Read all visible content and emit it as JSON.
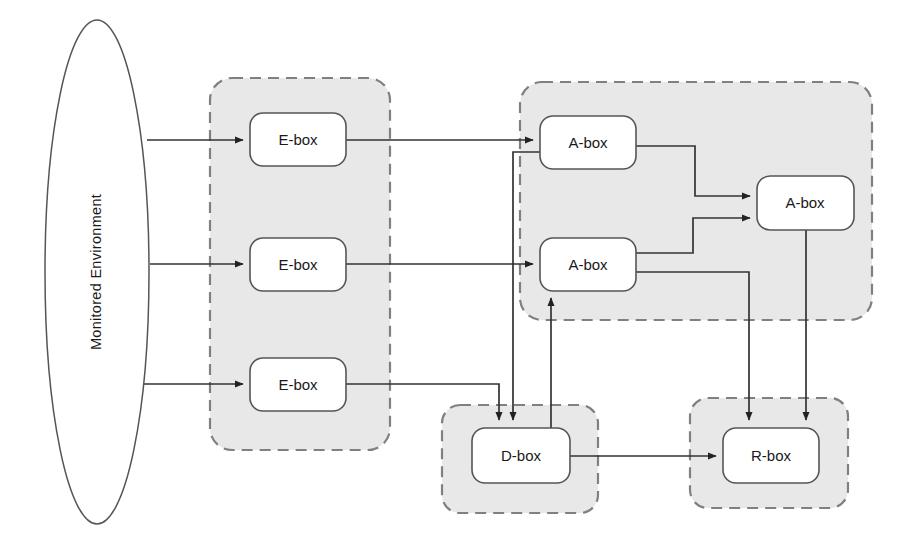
{
  "diagram": {
    "canvas": {
      "width": 902,
      "height": 544,
      "background": "#ffffff"
    },
    "colors": {
      "group_fill": "#e8e8e8",
      "group_stroke": "#808080",
      "node_fill": "#ffffff",
      "node_stroke": "#555555",
      "edge_stroke": "#333333",
      "text": "#1a1a1a"
    },
    "environment": {
      "label": "Monitored Environment",
      "shape": "ellipse",
      "orientation": "vertical-text"
    },
    "groups": [
      {
        "id": "e-group",
        "label": "",
        "x": 210,
        "y": 78,
        "width": 180,
        "height": 372
      },
      {
        "id": "a-group",
        "label": "",
        "x": 520,
        "y": 82,
        "width": 352,
        "height": 238
      },
      {
        "id": "d-group",
        "label": "",
        "x": 442,
        "y": 405,
        "width": 156,
        "height": 108
      },
      {
        "id": "r-group",
        "label": "",
        "x": 690,
        "y": 398,
        "width": 158,
        "height": 110
      }
    ],
    "nodes": [
      {
        "id": "e1",
        "label": "E-box",
        "group": "e-group",
        "x": 250,
        "y": 113,
        "width": 96,
        "height": 53
      },
      {
        "id": "e2",
        "label": "E-box",
        "group": "e-group",
        "x": 250,
        "y": 238,
        "width": 96,
        "height": 53
      },
      {
        "id": "e3",
        "label": "E-box",
        "group": "e-group",
        "x": 250,
        "y": 358,
        "width": 96,
        "height": 53
      },
      {
        "id": "a1",
        "label": "A-box",
        "group": "a-group",
        "x": 540,
        "y": 116,
        "width": 96,
        "height": 53
      },
      {
        "id": "a2",
        "label": "A-box",
        "group": "a-group",
        "x": 540,
        "y": 238,
        "width": 96,
        "height": 53
      },
      {
        "id": "a3",
        "label": "A-box",
        "group": "a-group",
        "x": 757,
        "y": 176,
        "width": 97,
        "height": 54
      },
      {
        "id": "d1",
        "label": "D-box",
        "group": "d-group",
        "x": 472,
        "y": 428,
        "width": 98,
        "height": 55
      },
      {
        "id": "r1",
        "label": "R-box",
        "group": "r-group",
        "x": 723,
        "y": 428,
        "width": 96,
        "height": 55
      }
    ],
    "edges": [
      {
        "id": "env-e1",
        "from": "environment",
        "to": "e1",
        "arrow": true
      },
      {
        "id": "env-e2",
        "from": "environment",
        "to": "e2",
        "arrow": true
      },
      {
        "id": "env-e3",
        "from": "environment",
        "to": "e3",
        "arrow": true
      },
      {
        "id": "e1-a1",
        "from": "e1",
        "to": "a1",
        "arrow": true
      },
      {
        "id": "e2-a2",
        "from": "e2",
        "to": "a2",
        "arrow": true
      },
      {
        "id": "e3-d1",
        "from": "e3",
        "to": "d1",
        "arrow": true
      },
      {
        "id": "a1-a3",
        "from": "a1",
        "to": "a3",
        "arrow": true
      },
      {
        "id": "a2-a3",
        "from": "a2",
        "to": "a3",
        "arrow": true
      },
      {
        "id": "a1-d1",
        "from": "a1",
        "to": "d1",
        "arrow": true
      },
      {
        "id": "a2-r1",
        "from": "a2",
        "to": "r1",
        "arrow": true
      },
      {
        "id": "a3-r1",
        "from": "a3",
        "to": "r1",
        "arrow": true
      },
      {
        "id": "d1-a2",
        "from": "d1",
        "to": "a2",
        "arrow": true
      },
      {
        "id": "d1-r1",
        "from": "d1",
        "to": "r1",
        "arrow": true
      }
    ]
  }
}
